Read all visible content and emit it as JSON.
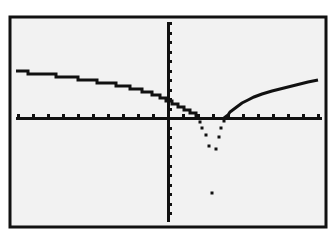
{
  "window": {
    "title": "Graphing calculator graph screen"
  },
  "colors": {
    "background": "#ffffff",
    "screen": "#f2f2f2",
    "ink": "#111111"
  },
  "frame": {
    "x": 10,
    "y": 17,
    "width": 316,
    "height": 210,
    "border": 3
  },
  "axes": {
    "x_axis_y": 118,
    "y_axis_x": 168,
    "x_range_px": [
      16,
      322
    ],
    "y_range_px": [
      22,
      222
    ],
    "x_tick_spacing_px": 15,
    "y_tick_spacing_px": 9.5
  },
  "chart_data": {
    "type": "line",
    "title": "",
    "xlabel": "",
    "ylabel": "",
    "grid": false,
    "legend": "none",
    "xlim": [
      -10,
      10
    ],
    "ylim": [
      -10,
      10
    ],
    "x_tick_step": 1,
    "y_tick_step": 1,
    "series": [
      {
        "name": "Y1",
        "style": "connected-pixels",
        "points_px": [
          [
            16,
            71
          ],
          [
            28,
            71
          ],
          [
            28,
            74
          ],
          [
            56,
            74
          ],
          [
            56,
            77
          ],
          [
            78,
            77
          ],
          [
            78,
            80
          ],
          [
            97,
            80
          ],
          [
            97,
            83
          ],
          [
            116,
            83
          ],
          [
            116,
            86
          ],
          [
            130,
            86
          ],
          [
            130,
            89
          ],
          [
            142,
            89
          ],
          [
            142,
            92
          ],
          [
            152,
            92
          ],
          [
            152,
            95
          ],
          [
            160,
            95
          ],
          [
            160,
            98
          ],
          [
            166,
            98
          ],
          [
            166,
            101
          ],
          [
            172,
            101
          ],
          [
            172,
            104
          ],
          [
            178,
            104
          ],
          [
            178,
            107
          ],
          [
            184,
            107
          ],
          [
            184,
            110
          ],
          [
            190,
            110
          ],
          [
            190,
            113
          ],
          [
            196,
            113
          ],
          [
            196,
            116
          ],
          [
            200,
            119
          ]
        ]
      },
      {
        "name": "Y1-dip",
        "style": "dots",
        "points_px": [
          [
            200,
            122
          ],
          [
            202,
            128
          ],
          [
            206,
            135
          ],
          [
            209,
            146
          ],
          [
            216,
            149
          ],
          [
            219,
            137
          ],
          [
            221,
            128
          ],
          [
            224,
            121
          ]
        ]
      },
      {
        "name": "Y1-right",
        "style": "connected-pixels",
        "points_px": [
          [
            224,
            118
          ],
          [
            228,
            115
          ],
          [
            230,
            112
          ],
          [
            234,
            109
          ],
          [
            238,
            106
          ],
          [
            242,
            103
          ],
          [
            248,
            100
          ],
          [
            254,
            97
          ],
          [
            262,
            94
          ],
          [
            272,
            91
          ],
          [
            284,
            88
          ],
          [
            296,
            85
          ],
          [
            308,
            82
          ],
          [
            318,
            80
          ]
        ]
      },
      {
        "name": "Y1-isolated",
        "style": "dots",
        "points_px": [
          [
            212,
            193
          ]
        ]
      }
    ]
  }
}
